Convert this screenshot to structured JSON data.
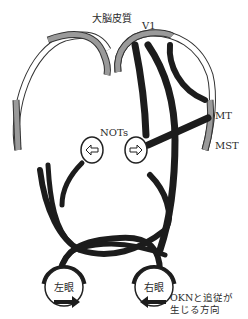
{
  "labels": {
    "cortex": "大脳皮質",
    "v1": "V1",
    "mt": "MT",
    "mst": "MST",
    "nots": "NOTs",
    "left_eye": "左眼",
    "right_eye": "右眼",
    "direction_line1": "OKNと追従が",
    "direction_line2": "生じる方向"
  },
  "colors": {
    "pathway": "#1c1c1c",
    "cortex_gray": "#9a9a9a",
    "outline": "#333333",
    "background": "#ffffff"
  }
}
